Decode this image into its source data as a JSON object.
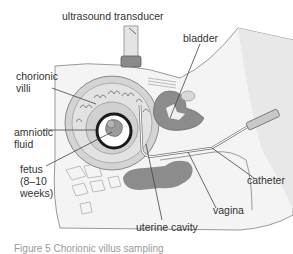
{
  "diagram": {
    "type": "anatomical illustration",
    "colors": {
      "tissue_light": "#e6e6e6",
      "tissue_mid": "#c8c8c8",
      "tissue_dark": "#8c8c8c",
      "outline": "#6e6e6e",
      "label_text": "#333333",
      "leader_line": "#444444"
    },
    "labels": {
      "ultrasound_transducer": "ultrasound transducer",
      "bladder": "bladder",
      "chorionic_villi_1": "chorionic",
      "chorionic_villi_2": "villi",
      "amniotic_fluid_1": "amniotic",
      "amniotic_fluid_2": "fluid",
      "fetus_1": "fetus",
      "fetus_2": "(8–10",
      "fetus_3": "weeks)",
      "catheter": "catheter",
      "uterine_cavity": "uterine cavity",
      "vagina": "vagina"
    },
    "caption": "Figure 5  Chorionic villus sampling"
  }
}
